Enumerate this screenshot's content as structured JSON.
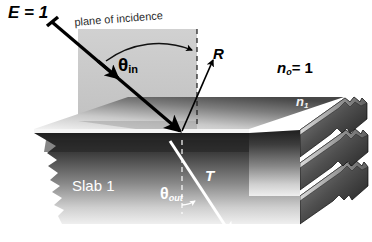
{
  "figure": {
    "background_color": "#ffffff"
  },
  "labels": {
    "incident_amplitude": "E = 1",
    "plane_of_incidence": "plane of incidence",
    "theta_symbol": "θ",
    "theta_in_sub": "in",
    "theta_out_sub": "out",
    "reflected_ray": "R",
    "transmitted_ray": "T",
    "index_outside_n": "n",
    "index_outside_sub": "o",
    "index_outside_eq": "= 1",
    "index_slab_n": "n",
    "index_slab_sub": "1",
    "slab_name": "Slab 1"
  },
  "colors": {
    "ink": "#000000",
    "white_label": "#ffffff",
    "plane_fill": "#b9b9b9",
    "slab_top_light": "#f0f0f0",
    "slab_top_dark": "#4a4a4a",
    "slab_front_dark": "#2a2a2a",
    "slab_front_light": "#d8d8d8",
    "slab_edge": "#ffffff"
  },
  "elements": [
    {
      "name": "incident-ray",
      "kind": "arrow",
      "color": "#000000",
      "label": "E = 1"
    },
    {
      "name": "reflected-ray",
      "kind": "arrow",
      "color": "#000000",
      "label": "R"
    },
    {
      "name": "transmitted-ray",
      "kind": "arrow",
      "color": "#ffffff",
      "label": "T"
    },
    {
      "name": "surface-normal",
      "kind": "dashed-line",
      "color": "#000000"
    },
    {
      "name": "angle-arc-in",
      "kind": "arc",
      "color": "#000000",
      "label": "θin"
    },
    {
      "name": "angle-arc-out",
      "kind": "arc",
      "color": "#ffffff",
      "label": "θout"
    },
    {
      "name": "plane-of-incidence-rect",
      "kind": "rectangle",
      "color": "#b9b9b9"
    },
    {
      "name": "slab-body",
      "kind": "parallelepiped",
      "color": "#777777"
    },
    {
      "name": "slab-stack-layers",
      "kind": "stacked-layers",
      "count": 3
    }
  ],
  "geometry": {
    "theta_in_degrees": 45,
    "theta_out_degrees": 27,
    "n_outside": 1
  }
}
